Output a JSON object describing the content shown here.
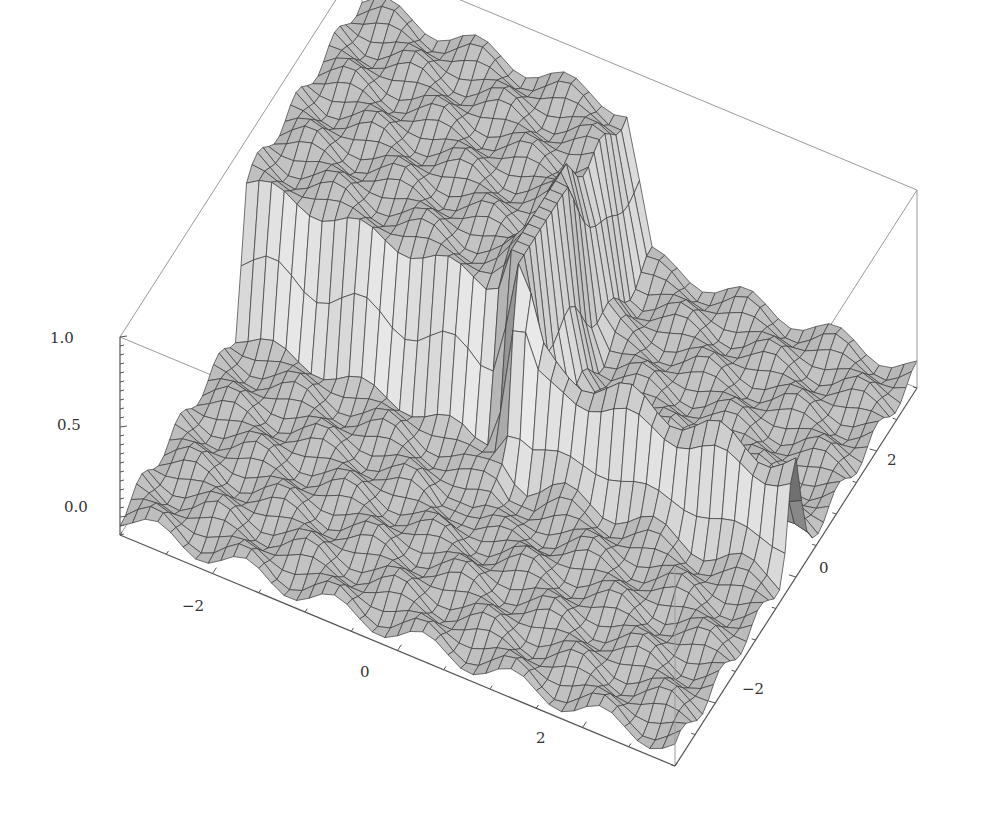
{
  "chart_data": {
    "type": "surface3d",
    "title": "",
    "xlabel": "",
    "ylabel": "",
    "zlabel": "",
    "x_range": [
      -3,
      3
    ],
    "y_range": [
      -3,
      3
    ],
    "z_range": [
      -0.1,
      1.0
    ],
    "x_ticks": [
      "-2",
      "0",
      "2"
    ],
    "y_ticks": [
      "-2",
      "0",
      "2"
    ],
    "z_ticks": [
      "0.0",
      "0.5",
      "1.0"
    ],
    "mesh": true,
    "boxed": true,
    "surface_color": "#c8c8c8",
    "mesh_color": "#333333"
  },
  "axes": {
    "z_labels": [
      "1.0",
      "0.5",
      "0.0"
    ],
    "x_labels": [
      "-2",
      "0",
      "2"
    ],
    "y_labels": [
      "2",
      "0",
      "-2"
    ]
  }
}
